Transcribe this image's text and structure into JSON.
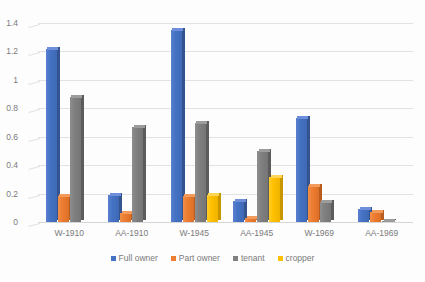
{
  "chart_data": {
    "type": "bar",
    "title": "",
    "xlabel": "",
    "ylabel": "",
    "ylim": [
      0,
      1.4
    ],
    "yticks": [
      "0",
      "0.2",
      "0.4",
      "0.6",
      "0.8",
      "1",
      "1.2",
      "1.4"
    ],
    "grid": true,
    "legend_position": "bottom",
    "categories": [
      "W-1910",
      "AA-1910",
      "W-1945",
      "AA-1945",
      "W-1969",
      "AA-1969"
    ],
    "series": [
      {
        "name": "Full owner",
        "color": "#4472C4",
        "values": [
          1.22,
          0.19,
          1.35,
          0.15,
          0.73,
          0.09
        ]
      },
      {
        "name": "Part owner",
        "color": "#ED7D31",
        "values": [
          0.18,
          0.06,
          0.18,
          0.03,
          0.25,
          0.07
        ]
      },
      {
        "name": "tenant",
        "color": "#808080",
        "values": [
          0.88,
          0.67,
          0.7,
          0.5,
          0.14,
          0.01
        ]
      },
      {
        "name": "cropper",
        "color": "#FFC000",
        "values": [
          0,
          0,
          0.19,
          0.32,
          0,
          0
        ]
      }
    ]
  }
}
